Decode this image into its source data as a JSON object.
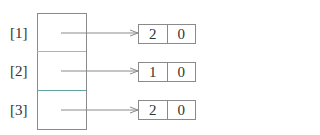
{
  "diagram": {
    "type": "array-of-pointers",
    "rows": [
      {
        "index_label": "[1]",
        "divider_color": "#d9a0a0",
        "target": {
          "values": [
            "2",
            "0"
          ]
        }
      },
      {
        "index_label": "[2]",
        "divider_color": "#5fa3a3",
        "target": {
          "values": [
            "1",
            "0"
          ]
        }
      },
      {
        "index_label": "[3]",
        "target": {
          "values": [
            "2",
            "0"
          ]
        }
      }
    ],
    "colors": {
      "line": "#8a8a8a",
      "text": "#333333"
    }
  }
}
